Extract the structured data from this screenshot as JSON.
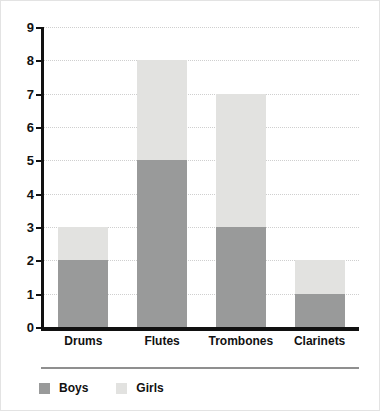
{
  "chart_data": {
    "type": "bar",
    "subtype": "stacked-vertical",
    "title": "",
    "xlabel": "",
    "ylabel": "",
    "categories": [
      "Drums",
      "Flutes",
      "Trombones",
      "Clarinets"
    ],
    "series": [
      {
        "name": "Boys",
        "color": "#999a9a",
        "values": [
          2,
          5,
          3,
          1
        ]
      },
      {
        "name": "Girls",
        "color": "#e2e2e0",
        "values": [
          1,
          3,
          4,
          1
        ]
      }
    ],
    "totals": [
      3,
      8,
      7,
      2
    ],
    "ylim": [
      0,
      9
    ],
    "ytick_labels": [
      "0",
      "1",
      "2",
      "3",
      "4",
      "5",
      "6",
      "7",
      "8",
      "9"
    ],
    "ytick_values": [
      0,
      1,
      2,
      3,
      4,
      5,
      6,
      7,
      8,
      9
    ],
    "grid": true,
    "grid_style": "dotted",
    "grid_color": "#cfcfcf",
    "legend_position": "bottom-left",
    "axis_color": "#111111",
    "background": "#ffffff"
  },
  "legend": {
    "items": [
      {
        "label": "Boys",
        "color": "#999a9a"
      },
      {
        "label": "Girls",
        "color": "#e2e2e0"
      }
    ]
  }
}
